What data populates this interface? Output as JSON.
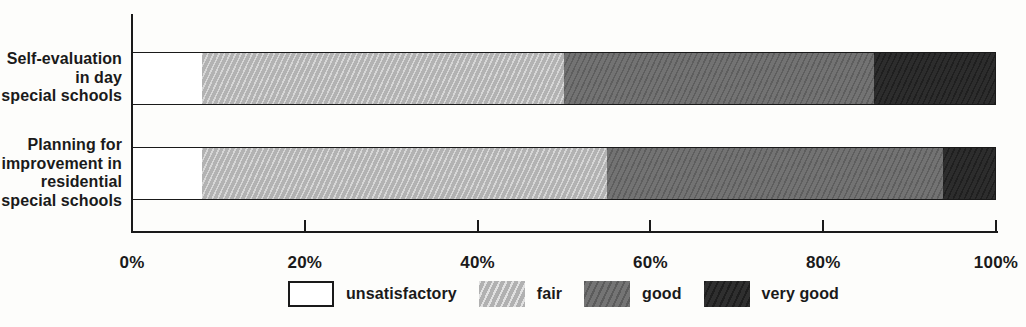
{
  "chart_data": {
    "type": "bar",
    "orientation": "horizontal",
    "stacked": true,
    "unit": "%",
    "title": "",
    "xlabel": "",
    "ylabel": "",
    "xlim": [
      0,
      100
    ],
    "x_ticks": [
      "0%",
      "20%",
      "40%",
      "60%",
      "80%",
      "100%"
    ],
    "x_tick_values": [
      0,
      20,
      40,
      60,
      80,
      100
    ],
    "grid": false,
    "legend_position": "bottom",
    "categories": [
      "Self-evaluation in day special schools",
      "Planning for improvement in residential special schools"
    ],
    "category_label_lines": [
      [
        "Self-evaluation",
        "in day",
        "special schools"
      ],
      [
        "Planning for",
        "improvement in",
        "residential",
        "special schools"
      ]
    ],
    "series": [
      {
        "name": "unsatisfactory",
        "values": [
          8,
          8
        ],
        "color": "#ffffff",
        "pattern": "none"
      },
      {
        "name": "fair",
        "values": [
          42,
          47
        ],
        "color": "#bcbcbc",
        "pattern": "hatch-light"
      },
      {
        "name": "good",
        "values": [
          36,
          39
        ],
        "color": "#6d6d6d",
        "pattern": "hatch-dark"
      },
      {
        "name": "very good",
        "values": [
          14,
          6
        ],
        "color": "#242424",
        "pattern": "hatch-dark"
      }
    ],
    "axis_color": "#1a1a1a"
  }
}
